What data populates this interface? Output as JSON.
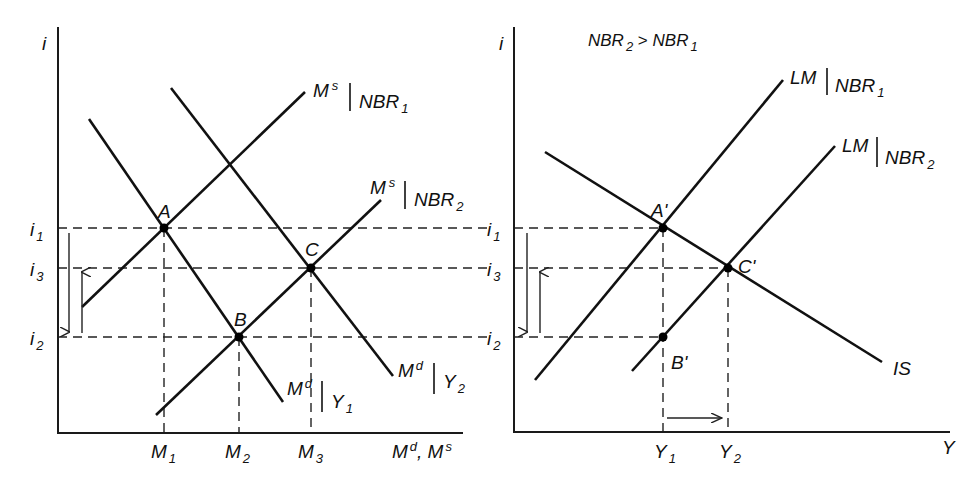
{
  "left_panel": {
    "y_axis_label": "i",
    "x_axis_label": "M^d, M^s",
    "y_ticks": [
      {
        "base": "i",
        "sub": "1",
        "name": "i1"
      },
      {
        "base": "i",
        "sub": "3",
        "name": "i3"
      },
      {
        "base": "i",
        "sub": "2",
        "name": "i2"
      }
    ],
    "x_ticks": [
      {
        "base": "M",
        "sub": "1"
      },
      {
        "base": "M",
        "sub": "2"
      },
      {
        "base": "M",
        "sub": "3"
      }
    ],
    "curves": [
      {
        "name": "Md|Y1",
        "base": "M",
        "sup": "d",
        "cond": "Y",
        "cond_sub": "1"
      },
      {
        "name": "Md|Y2",
        "base": "M",
        "sup": "d",
        "cond": "Y",
        "cond_sub": "2"
      },
      {
        "name": "Ms|NBR1",
        "base": "M",
        "sup": "s",
        "cond": "NBR",
        "cond_sub": "1"
      },
      {
        "name": "Ms|NBR2",
        "base": "M",
        "sup": "s",
        "cond": "NBR",
        "cond_sub": "2"
      }
    ],
    "points": [
      "A",
      "B",
      "C"
    ],
    "x_axis_base1": "M",
    "x_axis_sup1": "d",
    "x_axis_sep": ", M",
    "x_axis_sup2": "s"
  },
  "right_panel": {
    "y_axis_label": "i",
    "x_axis_label": "Y",
    "condition": {
      "left": "NBR",
      "left_sub": "2",
      "op": " > ",
      "right": "NBR",
      "right_sub": "1"
    },
    "y_ticks": [
      {
        "base": "i",
        "sub": "1"
      },
      {
        "base": "i",
        "sub": "3"
      },
      {
        "base": "i",
        "sub": "2"
      }
    ],
    "x_ticks": [
      {
        "base": "Y",
        "sub": "1"
      },
      {
        "base": "Y",
        "sub": "2"
      }
    ],
    "curves": [
      {
        "name": "LM|NBR1",
        "base": "LM",
        "cond": "NBR",
        "cond_sub": "1"
      },
      {
        "name": "LM|NBR2",
        "base": "LM",
        "cond": "NBR",
        "cond_sub": "2"
      },
      {
        "name": "IS",
        "base": "IS"
      }
    ],
    "points": [
      "A'",
      "B'",
      "C'"
    ]
  },
  "colors": {
    "ink": "#111111",
    "background": "#ffffff"
  }
}
